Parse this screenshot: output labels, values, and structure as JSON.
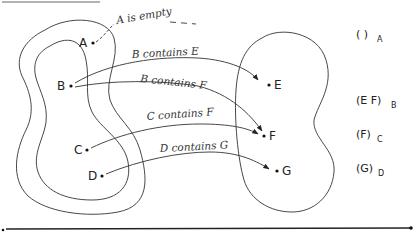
{
  "diagram": {
    "type": "set-containment mapping diagram",
    "left_points": [
      {
        "id": "A",
        "label": "A",
        "x": 88,
        "y": 43
      },
      {
        "id": "B",
        "label": "B",
        "x": 70,
        "y": 85
      },
      {
        "id": "C",
        "label": "C",
        "x": 86,
        "y": 150
      },
      {
        "id": "D",
        "label": "D",
        "x": 101,
        "y": 176
      }
    ],
    "right_points": [
      {
        "id": "E",
        "label": "E",
        "x": 269,
        "y": 85
      },
      {
        "id": "F",
        "label": "F",
        "x": 264,
        "y": 135
      },
      {
        "id": "G",
        "label": "G",
        "x": 276,
        "y": 170
      }
    ],
    "relations": [
      {
        "from": "A",
        "to": null,
        "label": "A is empty",
        "style": "dashed"
      },
      {
        "from": "B",
        "to": "E",
        "label": "B contains E",
        "style": "arrow"
      },
      {
        "from": "B",
        "to": "F",
        "label": "B contains F",
        "style": "arrow"
      },
      {
        "from": "C",
        "to": "F",
        "label": "C contains F",
        "style": "arrow"
      },
      {
        "from": "D",
        "to": "G",
        "label": "D contains G",
        "style": "arrow"
      }
    ],
    "sets": [
      {
        "contents": "( )",
        "subscript": "A"
      },
      {
        "contents": "(E  F)",
        "subscript": "B"
      },
      {
        "contents": "(F)",
        "subscript": "C"
      },
      {
        "contents": "(G)",
        "subscript": "D"
      }
    ]
  }
}
